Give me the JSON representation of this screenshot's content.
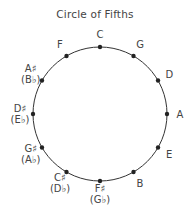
{
  "title": "Circle of Fifths",
  "keys": [
    {
      "name": "C",
      "alt": null
    },
    {
      "name": "G",
      "alt": null
    },
    {
      "name": "D",
      "alt": null
    },
    {
      "name": "A",
      "alt": null
    },
    {
      "name": "E",
      "alt": null
    },
    {
      "name": "B",
      "alt": null
    },
    {
      "name": "F♯",
      "alt": "(G♭)"
    },
    {
      "name": "C♯",
      "alt": "(D♭)"
    },
    {
      "name": "G♯",
      "alt": "(A♭)"
    },
    {
      "name": "D♯",
      "alt": "(E♭)"
    },
    {
      "name": "A♯",
      "alt": "(B♭)"
    },
    {
      "name": "F",
      "alt": null
    }
  ],
  "colors": {
    "line": "#333333",
    "dot": "#222222",
    "text": "#444444"
  }
}
